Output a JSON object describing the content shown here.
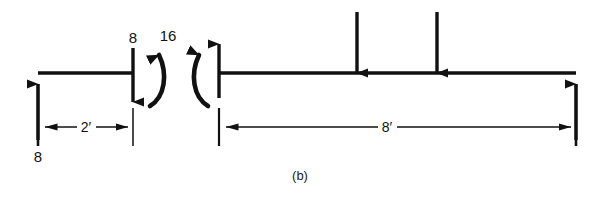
{
  "figure": {
    "caption": "(b)",
    "background_color": "#ffffff",
    "ink_color": "#111111"
  },
  "left_segment": {
    "reaction_label": "8",
    "shear_label": "8",
    "moment_label": "16",
    "dimension_label": "2′"
  },
  "right_segment": {
    "dimension_label": "8′"
  }
}
